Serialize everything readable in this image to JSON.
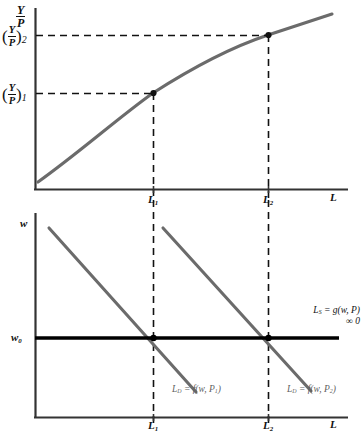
{
  "figure": {
    "type": "economics-diagram"
  },
  "upper_panel": {
    "y_axis_label_numerator": "Y",
    "y_axis_label_denominator": "P",
    "x_axis_label": "L",
    "y_ticks": [
      {
        "numerator": "Y",
        "denominator": "P",
        "subscript": "2"
      },
      {
        "numerator": "Y",
        "denominator": "P",
        "subscript": "1"
      }
    ],
    "x_ticks": [
      {
        "base": "L",
        "subscript": "1"
      },
      {
        "base": "L",
        "subscript": "2"
      }
    ]
  },
  "lower_panel": {
    "y_axis_label": "w",
    "y_tick_base": "w",
    "y_tick_subscript": "0",
    "x_axis_label": "L",
    "x_ticks": [
      {
        "base": "L",
        "subscript": "1"
      },
      {
        "base": "L",
        "subscript": "2"
      }
    ],
    "demand_label_1": "L_D = f(w, P_1)",
    "demand_label_2": "L_D = f(w, P_2)",
    "supply_label_line1": "L_S = g(w, P)",
    "supply_label_line2": "∞ 0"
  },
  "colors": {
    "curve": "#6b6b6b",
    "axis": "#333333",
    "dashed": "#111111",
    "supply_line": "#000000",
    "text": "#111111",
    "curve_label_text": "#5f5f5f"
  },
  "chart_data": {
    "type": "line",
    "panels": [
      {
        "name": "production-function",
        "xlabel": "L",
        "ylabel": "Y/P",
        "curve_name": "production function",
        "points": [
          [
            38,
            182
          ],
          [
            70,
            155
          ],
          [
            105,
            128
          ],
          [
            140,
            105
          ],
          [
            153,
            93
          ],
          [
            190,
            73
          ],
          [
            230,
            53
          ],
          [
            268,
            35
          ],
          [
            300,
            24
          ],
          [
            330,
            15
          ]
        ],
        "marked_points": [
          {
            "x": 153,
            "y": 93,
            "x_label": "L1",
            "y_label": "(Y/P)1"
          },
          {
            "x": 268,
            "y": 35,
            "x_label": "L2",
            "y_label": "(Y/P)2"
          }
        ]
      },
      {
        "name": "labor-market",
        "xlabel": "L",
        "ylabel": "w",
        "series": [
          {
            "name": "L_D = f(w, P_1)",
            "points": [
              [
                49,
                228
              ],
              [
                195,
                391
              ]
            ]
          },
          {
            "name": "L_D = f(w, P_2)",
            "points": [
              [
                163,
                228
              ],
              [
                310,
                390
              ]
            ]
          },
          {
            "name": "L_S = g(w, P)",
            "points": [
              [
                36,
                338
              ],
              [
                338,
                338
              ]
            ]
          }
        ],
        "equilibria": [
          {
            "x": 153,
            "y": 338,
            "label": "L1 at w0"
          },
          {
            "x": 268,
            "y": 338,
            "label": "L2 at w0"
          }
        ]
      }
    ]
  }
}
